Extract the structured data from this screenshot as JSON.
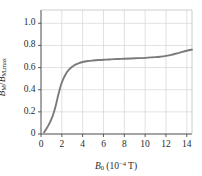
{
  "chart_data": {
    "type": "line",
    "title": "",
    "xlabel": "B0 (10^-4 T)",
    "ylabel": "BM / BM,max",
    "xlim": [
      0,
      14.5
    ],
    "ylim": [
      0,
      1.12
    ],
    "grid": true,
    "legend": null,
    "line_color": "#7a7a7a",
    "x_ticks": [
      0,
      2,
      4,
      6,
      8,
      10,
      12,
      14
    ],
    "y_ticks": [
      0,
      0.2,
      0.4,
      0.6,
      0.8,
      1.0
    ],
    "x_tick_labels": [
      "0",
      "2",
      "4",
      "6",
      "8",
      "10",
      "12",
      "14"
    ],
    "y_tick_labels": [
      "0",
      "0.2",
      "0.4",
      "0.6",
      "0.8",
      "1.0"
    ],
    "series": [
      {
        "name": "magnetization",
        "x": [
          0.3,
          0.5,
          0.75,
          1.0,
          1.2,
          1.4,
          1.6,
          1.8,
          2.0,
          2.2,
          2.4,
          2.6,
          2.8,
          3.0,
          3.3,
          3.6,
          4.0,
          4.5,
          5.0,
          5.5,
          6.0,
          6.5,
          7.0,
          7.5,
          8.0,
          9.0,
          10.0,
          11.0,
          11.5,
          12.0,
          12.5,
          13.0,
          13.5,
          14.0,
          14.5
        ],
        "y": [
          0.015,
          0.045,
          0.085,
          0.135,
          0.185,
          0.25,
          0.33,
          0.405,
          0.465,
          0.51,
          0.545,
          0.572,
          0.592,
          0.608,
          0.626,
          0.638,
          0.65,
          0.659,
          0.664,
          0.668,
          0.671,
          0.673,
          0.676,
          0.678,
          0.68,
          0.684,
          0.688,
          0.694,
          0.699,
          0.706,
          0.715,
          0.727,
          0.74,
          0.752,
          0.762
        ]
      }
    ]
  },
  "axes": {
    "x_title_symbol": "B",
    "x_title_sub": "0",
    "x_title_unit_open": " (10",
    "x_title_exp": "−4",
    "x_title_unit_close": " T)",
    "y_title_num_symbol": "B",
    "y_title_num_sub": "M",
    "y_title_slash": "/",
    "y_title_den_symbol": "B",
    "y_title_den_sub": "M,max"
  }
}
